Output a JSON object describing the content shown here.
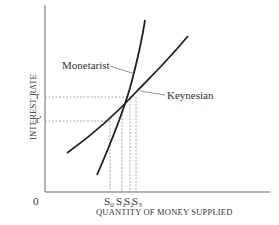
{
  "diagram": {
    "y_axis_label": "INTEREST RATE",
    "x_axis_label": "QUANTITY OF MONEY SUPPLIED",
    "origin_label": "0",
    "y_ticks": [
      {
        "label": "r",
        "y": 97
      },
      {
        "label": "r′",
        "y": 121
      }
    ],
    "x_ticks": [
      {
        "label": "S",
        "sub": "0",
        "x": 110
      },
      {
        "label": "S",
        "sub": "1",
        "x": 122
      },
      {
        "label": "S",
        "sub": "2",
        "x": 130
      },
      {
        "label": "S",
        "sub": "3",
        "x": 136
      }
    ],
    "curves": [
      {
        "name": "Monetarist",
        "label": "Monetarist"
      },
      {
        "name": "Keynesian",
        "label": "Keynesian"
      }
    ],
    "colors": {
      "line": "#222222",
      "dash": "#888888",
      "axis": "#555555"
    }
  }
}
